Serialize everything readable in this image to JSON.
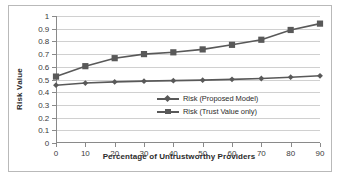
{
  "chart_data": {
    "type": "line",
    "title": "",
    "xlabel": "Percentage of Untrustworthy Providers",
    "ylabel": "Risk Value",
    "x": [
      0,
      10,
      20,
      30,
      40,
      50,
      60,
      70,
      80,
      90
    ],
    "xticklabels": [
      "0",
      "10",
      "20",
      "30",
      "40",
      "50",
      "60",
      "70",
      "80",
      "90"
    ],
    "yticklabels": [
      "0",
      "0.1",
      "0.2",
      "0.3",
      "0.4",
      "0.5",
      "0.6",
      "0.7",
      "0.8",
      "0.9",
      "1"
    ],
    "yticks": [
      0,
      0.1,
      0.2,
      0.3,
      0.4,
      0.5,
      0.6,
      0.7,
      0.8,
      0.9,
      1
    ],
    "xlim": [
      0,
      90
    ],
    "ylim": [
      0,
      1
    ],
    "grid": "horizontal",
    "legend_position": "inside-right-lower",
    "series": [
      {
        "name": "Risk (Proposed Model)",
        "marker": "diamond",
        "color": "#595959",
        "values": [
          0.455,
          0.472,
          0.481,
          0.487,
          0.491,
          0.495,
          0.501,
          0.508,
          0.518,
          0.529
        ]
      },
      {
        "name": "Risk (Trust Value only)",
        "marker": "square",
        "color": "#595959",
        "values": [
          0.523,
          0.605,
          0.668,
          0.7,
          0.714,
          0.737,
          0.773,
          0.813,
          0.89,
          0.94
        ]
      }
    ]
  },
  "legend": {
    "items": [
      {
        "label": "Risk (Proposed Model)"
      },
      {
        "label": "Risk (Trust Value only)"
      }
    ]
  },
  "axes": {
    "y_title": "Risk Value",
    "x_title": "Percentage of Untrustworthy Providers"
  },
  "colors": {
    "series": "#595959",
    "gridline": "#d0d0d0",
    "axis": "#8a8a8a",
    "frame": "#b9b9b9",
    "text": "#2b2b2b"
  }
}
